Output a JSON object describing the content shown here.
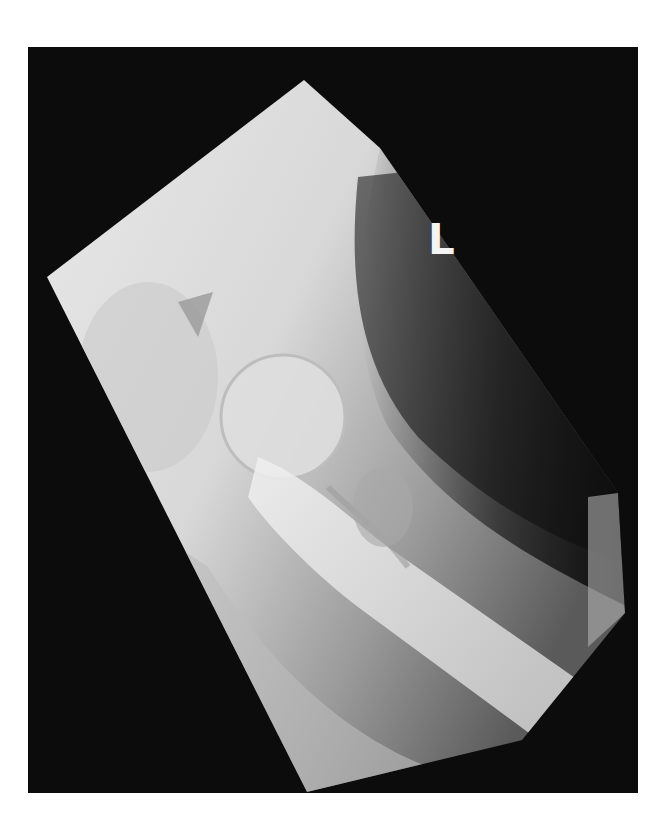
{
  "image": {
    "type": "radiograph",
    "description": "Lateral hip X-ray showing proximal femur, femoral head and acetabulum",
    "side_marker": "L",
    "colors": {
      "page_background": "#ffffff",
      "film_background": "#0c0c0c",
      "bone_bright": "#e6e6e6",
      "soft_tissue": "#8a8a8a",
      "marker": "#f4f4f4"
    }
  }
}
